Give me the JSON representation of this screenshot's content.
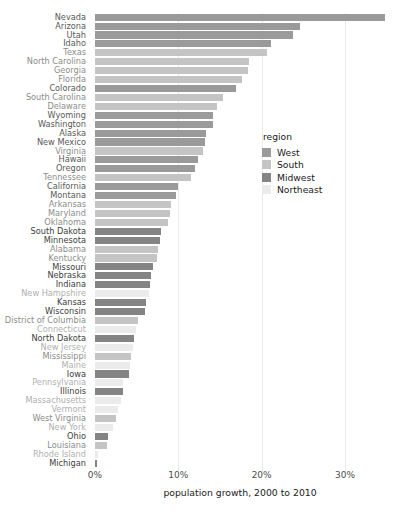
{
  "chart_data": {
    "type": "bar",
    "orientation": "horizontal",
    "title": "",
    "xlabel": "population growth, 2000 to 2010",
    "ylabel": "",
    "xlim": [
      0,
      34.8
    ],
    "xticks": [
      0,
      10,
      20,
      30
    ],
    "xtick_labels": [
      "0%",
      "10%",
      "20%",
      "30%"
    ],
    "grid": true,
    "grid_axis": "x",
    "legend": {
      "title": "region",
      "position": "right-inside",
      "entries": [
        {
          "label": "West",
          "color": "#9a9a9a"
        },
        {
          "label": "South",
          "color": "#c4c4c4"
        },
        {
          "label": "Midwest",
          "color": "#848484"
        },
        {
          "label": "Northeast",
          "color": "#ebebeb"
        }
      ]
    },
    "categories": [
      "Nevada",
      "Arizona",
      "Utah",
      "Idaho",
      "Texas",
      "North Carolina",
      "Georgia",
      "Florida",
      "Colorado",
      "South Carolina",
      "Delaware",
      "Wyoming",
      "Washington",
      "Alaska",
      "New Mexico",
      "Virginia",
      "Hawaii",
      "Oregon",
      "Tennessee",
      "California",
      "Montana",
      "Arkansas",
      "Maryland",
      "Oklahoma",
      "South Dakota",
      "Minnesota",
      "Alabama",
      "Kentucky",
      "Missouri",
      "Nebraska",
      "Indiana",
      "New Hampshire",
      "Kansas",
      "Wisconsin",
      "District of Columbia",
      "Connecticut",
      "North Dakota",
      "New Jersey",
      "Mississippi",
      "Maine",
      "Iowa",
      "Pennsylvania",
      "Illinois",
      "Massachusetts",
      "Vermont",
      "West Virginia",
      "New York",
      "Ohio",
      "Louisiana",
      "Rhode Island",
      "Michigan"
    ],
    "values": [
      34.8,
      24.6,
      23.8,
      21.1,
      20.6,
      18.5,
      18.3,
      17.6,
      16.9,
      15.3,
      14.6,
      14.1,
      14.1,
      13.3,
      13.2,
      13.0,
      12.3,
      12.0,
      11.5,
      10.0,
      9.7,
      9.1,
      9.0,
      8.7,
      7.9,
      7.8,
      7.5,
      7.4,
      7.0,
      6.7,
      6.6,
      6.5,
      6.1,
      6.0,
      5.2,
      4.9,
      4.7,
      4.5,
      4.3,
      4.2,
      4.1,
      3.4,
      3.3,
      3.1,
      2.8,
      2.5,
      2.1,
      1.6,
      1.4,
      0.4,
      0.2
    ],
    "series_group": [
      "West",
      "West",
      "West",
      "West",
      "South",
      "South",
      "South",
      "South",
      "West",
      "South",
      "South",
      "West",
      "West",
      "West",
      "West",
      "South",
      "West",
      "West",
      "South",
      "West",
      "West",
      "South",
      "South",
      "South",
      "Midwest",
      "Midwest",
      "South",
      "South",
      "Midwest",
      "Midwest",
      "Midwest",
      "Northeast",
      "Midwest",
      "Midwest",
      "South",
      "Northeast",
      "Midwest",
      "Northeast",
      "South",
      "Northeast",
      "Midwest",
      "Northeast",
      "Midwest",
      "Northeast",
      "Northeast",
      "South",
      "Northeast",
      "Midwest",
      "South",
      "Northeast",
      "Midwest"
    ]
  }
}
